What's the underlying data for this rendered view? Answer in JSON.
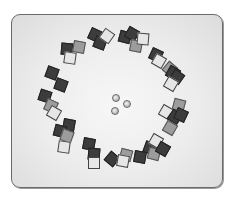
{
  "game": {
    "board": {
      "left": 11,
      "top": 14,
      "width": 212,
      "height": 174,
      "color": "#e8e8e8",
      "border_color": "#6a6a6a"
    },
    "tile_colors": {
      "dark": "#3c3c3c",
      "mid": "#9c9c9c",
      "light": "#e6e6e6"
    },
    "marbles": [
      {
        "x": 115,
        "y": 97
      },
      {
        "x": 126,
        "y": 103
      },
      {
        "x": 114,
        "y": 110
      }
    ],
    "tiles": [
      {
        "x": 94,
        "y": 34,
        "rot": 25,
        "shade": "dark"
      },
      {
        "x": 99,
        "y": 42,
        "rot": 20,
        "shade": "dark"
      },
      {
        "x": 106,
        "y": 35,
        "rot": 35,
        "shade": "light"
      },
      {
        "x": 124,
        "y": 36,
        "rot": 15,
        "shade": "dark"
      },
      {
        "x": 131,
        "y": 33,
        "rot": 30,
        "shade": "dark"
      },
      {
        "x": 135,
        "y": 45,
        "rot": 10,
        "shade": "mid"
      },
      {
        "x": 142,
        "y": 38,
        "rot": 5,
        "shade": "light"
      },
      {
        "x": 66,
        "y": 48,
        "rot": 5,
        "shade": "dark"
      },
      {
        "x": 78,
        "y": 46,
        "rot": 10,
        "shade": "mid"
      },
      {
        "x": 69,
        "y": 57,
        "rot": 8,
        "shade": "light"
      },
      {
        "x": 155,
        "y": 54,
        "rot": 25,
        "shade": "dark"
      },
      {
        "x": 158,
        "y": 60,
        "rot": 30,
        "shade": "light"
      },
      {
        "x": 169,
        "y": 68,
        "rot": 40,
        "shade": "mid"
      },
      {
        "x": 172,
        "y": 72,
        "rot": 30,
        "shade": "dark"
      },
      {
        "x": 176,
        "y": 76,
        "rot": 35,
        "shade": "dark"
      },
      {
        "x": 170,
        "y": 83,
        "rot": 30,
        "shade": "light"
      },
      {
        "x": 51,
        "y": 72,
        "rot": 20,
        "shade": "dark"
      },
      {
        "x": 60,
        "y": 84,
        "rot": 20,
        "shade": "dark"
      },
      {
        "x": 44,
        "y": 95,
        "rot": 18,
        "shade": "dark"
      },
      {
        "x": 50,
        "y": 105,
        "rot": 25,
        "shade": "mid"
      },
      {
        "x": 53,
        "y": 112,
        "rot": 30,
        "shade": "light"
      },
      {
        "x": 165,
        "y": 111,
        "rot": 30,
        "shade": "light"
      },
      {
        "x": 178,
        "y": 104,
        "rot": 15,
        "shade": "mid"
      },
      {
        "x": 174,
        "y": 116,
        "rot": 35,
        "shade": "dark"
      },
      {
        "x": 180,
        "y": 114,
        "rot": 25,
        "shade": "dark"
      },
      {
        "x": 169,
        "y": 127,
        "rot": 30,
        "shade": "mid"
      },
      {
        "x": 68,
        "y": 124,
        "rot": 10,
        "shade": "dark"
      },
      {
        "x": 59,
        "y": 130,
        "rot": 15,
        "shade": "dark"
      },
      {
        "x": 66,
        "y": 135,
        "rot": 20,
        "shade": "mid"
      },
      {
        "x": 63,
        "y": 146,
        "rot": 8,
        "shade": "light"
      },
      {
        "x": 88,
        "y": 143,
        "rot": 10,
        "shade": "dark"
      },
      {
        "x": 93,
        "y": 153,
        "rot": 5,
        "shade": "dark"
      },
      {
        "x": 93,
        "y": 162,
        "rot": 0,
        "shade": "light"
      },
      {
        "x": 111,
        "y": 158,
        "rot": 40,
        "shade": "dark"
      },
      {
        "x": 125,
        "y": 154,
        "rot": 15,
        "shade": "mid"
      },
      {
        "x": 122,
        "y": 160,
        "rot": 10,
        "shade": "light"
      },
      {
        "x": 139,
        "y": 156,
        "rot": 10,
        "shade": "dark"
      },
      {
        "x": 149,
        "y": 147,
        "rot": 20,
        "shade": "dark"
      },
      {
        "x": 153,
        "y": 153,
        "rot": 15,
        "shade": "mid"
      },
      {
        "x": 155,
        "y": 140,
        "rot": 30,
        "shade": "light"
      },
      {
        "x": 162,
        "y": 148,
        "rot": 30,
        "shade": "dark"
      }
    ]
  }
}
